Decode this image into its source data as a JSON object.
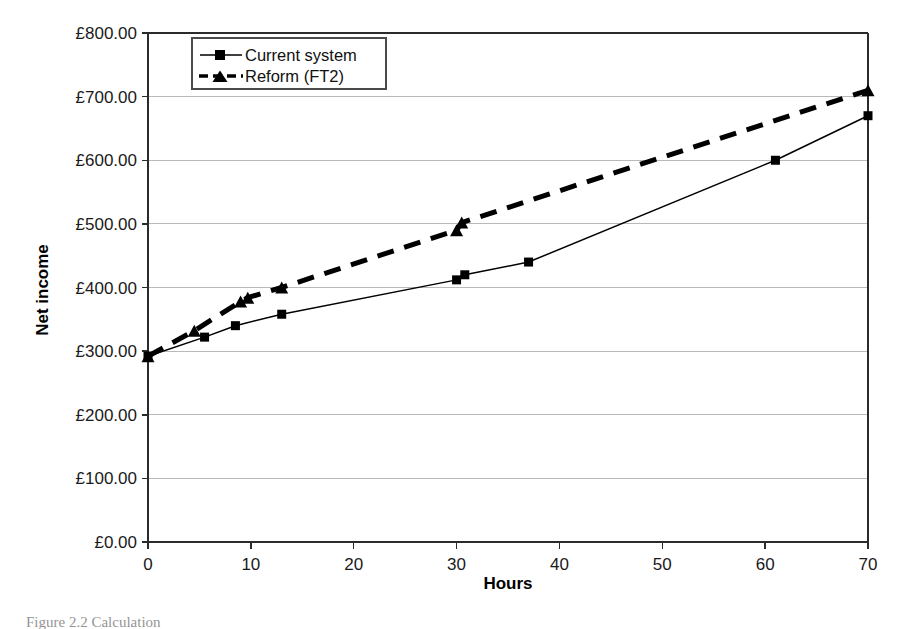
{
  "figure": {
    "caption": "Figure 2.2   Calculation"
  },
  "chart_data": {
    "type": "line",
    "title": "",
    "xlabel": "Hours",
    "ylabel": "Net income",
    "xlim": [
      0,
      70
    ],
    "ylim": [
      0,
      800
    ],
    "xticks": [
      0,
      10,
      20,
      30,
      40,
      50,
      60,
      70
    ],
    "xtick_labels": [
      "0",
      "10",
      "20",
      "30",
      "40",
      "50",
      "60",
      "70"
    ],
    "yticks": [
      0,
      100,
      200,
      300,
      400,
      500,
      600,
      700,
      800
    ],
    "ytick_labels": [
      "£0.00",
      "£100.00",
      "£200.00",
      "£300.00",
      "£400.00",
      "£500.00",
      "£600.00",
      "£700.00",
      "£800.00"
    ],
    "grid": "horizontal",
    "legend_position": "top-left-inside",
    "series": [
      {
        "name": "Current system",
        "marker": "square",
        "line_style": "solid",
        "color": "#000000",
        "points": [
          {
            "x": 0,
            "y": 292
          },
          {
            "x": 5.5,
            "y": 322
          },
          {
            "x": 8.5,
            "y": 340
          },
          {
            "x": 13,
            "y": 358
          },
          {
            "x": 30,
            "y": 412
          },
          {
            "x": 30.8,
            "y": 420
          },
          {
            "x": 37,
            "y": 440
          },
          {
            "x": 61,
            "y": 600
          },
          {
            "x": 70,
            "y": 670
          }
        ]
      },
      {
        "name": "Reform (FT2)",
        "marker": "triangle",
        "line_style": "dashed",
        "color": "#000000",
        "points": [
          {
            "x": 0,
            "y": 292
          },
          {
            "x": 4.5,
            "y": 332
          },
          {
            "x": 9.0,
            "y": 378
          },
          {
            "x": 9.7,
            "y": 384
          },
          {
            "x": 13,
            "y": 400
          },
          {
            "x": 30,
            "y": 490
          },
          {
            "x": 30.5,
            "y": 502
          },
          {
            "x": 70,
            "y": 710
          }
        ]
      }
    ]
  },
  "legend": {
    "entries": [
      {
        "label": "Current system"
      },
      {
        "label": "Reform (FT2)"
      }
    ]
  }
}
